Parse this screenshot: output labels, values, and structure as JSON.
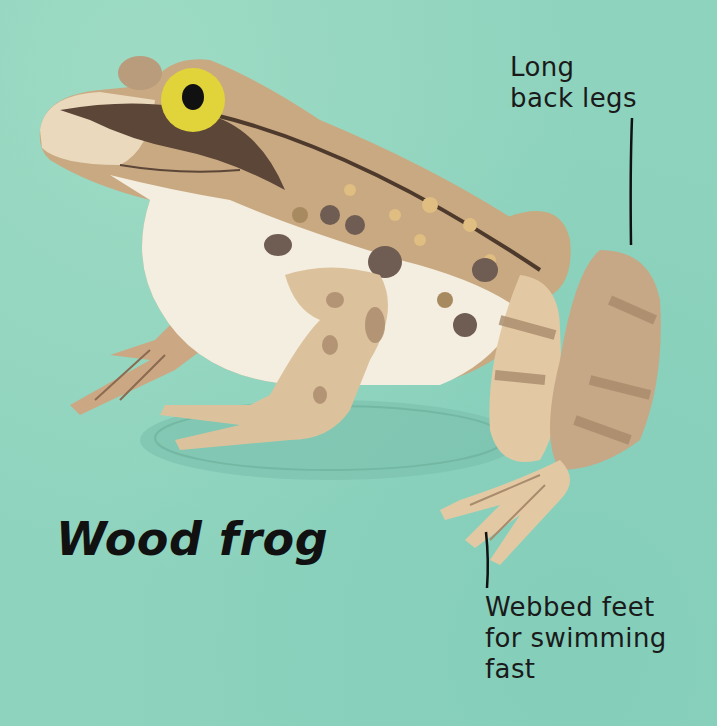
{
  "title": "Wood frog",
  "annotations": {
    "back_legs": {
      "lines": [
        "Long",
        "back legs"
      ]
    },
    "webbed_feet": {
      "lines": [
        "Webbed feet",
        "for swimming",
        "fast"
      ]
    }
  },
  "illustration": {
    "subject": "frog-illustration",
    "colors": {
      "background": "#8ed3be",
      "body_tan": "#c9a981",
      "belly_cream": "#f4eee0",
      "mask_dark": "#5b4638",
      "eye_yellow": "#e1d43a",
      "pupil": "#111111",
      "leg_light": "#e3c9a3",
      "stripe": "#a98b6d",
      "pointer_line": "#111111"
    }
  }
}
